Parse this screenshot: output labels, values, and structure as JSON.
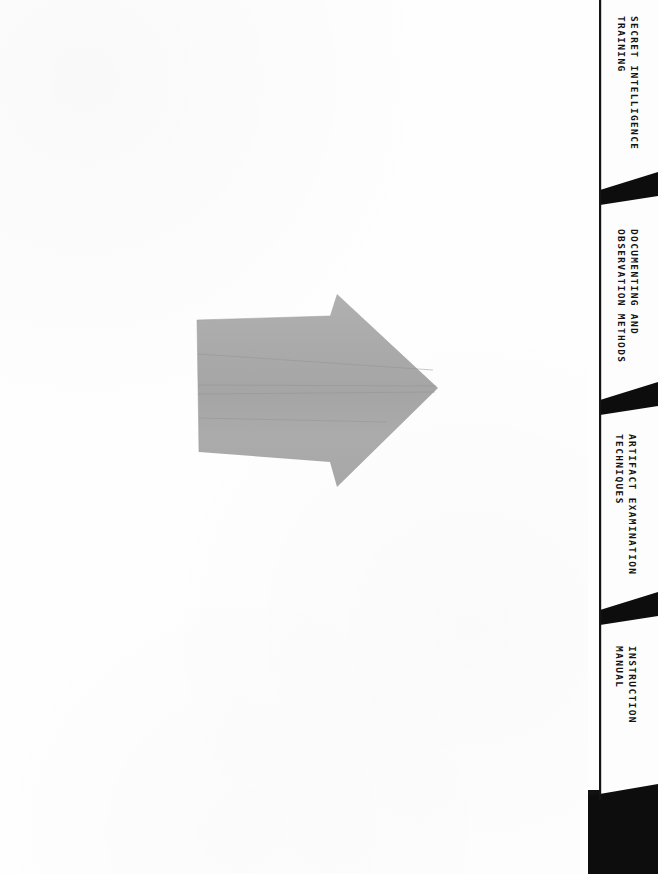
{
  "page": {
    "kind": "scanned-divider-page",
    "width": 658,
    "height": 874,
    "background_color": "#ffffff",
    "paper_color": "#fefefe"
  },
  "artwork": {
    "name": "cut-paper-arrow",
    "description": "Gray cut-paper arrow pointing right",
    "fill_color": "#a9aaa9",
    "edge_color": "#9a9b9a",
    "crease_color": "#909190",
    "direction": "right"
  },
  "tab_strip": {
    "spine_color": "#111111",
    "tab_face_color": "#fdfdfd",
    "notch_color": "#0d0d0d",
    "tabs": [
      {
        "index": 0,
        "name": "secret-intelligence-training",
        "line1": "SECRET INTELLIGENCE",
        "line2": "TRAINING"
      },
      {
        "index": 1,
        "name": "documenting-and-observation-methods",
        "line1": "DOCUMENTING AND",
        "line2": "OBSERVATION METHODS"
      },
      {
        "index": 2,
        "name": "artifact-examination-techniques",
        "line1": "ARTIFACT EXAMINATION",
        "line2": "TECHNIQUES"
      },
      {
        "index": 3,
        "name": "instruction-manual",
        "line1": "INSTRUCTION",
        "line2": "MANUAL"
      }
    ]
  }
}
